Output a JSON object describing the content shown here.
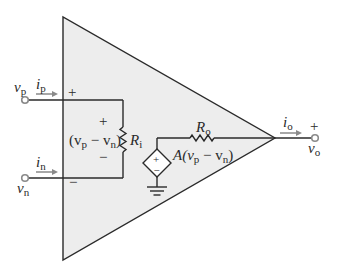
{
  "diagram": {
    "type": "op-amp equivalent circuit",
    "colors": {
      "background": "#ffffff",
      "amp_fill": "#ededed",
      "wire": "#2a2a2a",
      "terminal": "#8a8a8a",
      "arrow": "#8a8a8a"
    },
    "inputs": {
      "positive": {
        "voltage_label": "v",
        "voltage_sub": "p",
        "current_label": "i",
        "current_sub": "p",
        "sign": "+"
      },
      "negative": {
        "voltage_label": "v",
        "voltage_sub": "n",
        "current_label": "i",
        "current_sub": "n",
        "sign": "−"
      }
    },
    "input_resistor": {
      "label": "R",
      "sub": "i",
      "voltage_expr_open": "(v",
      "voltage_expr_p": "p",
      "voltage_expr_minus": " − v",
      "voltage_expr_n": "n",
      "voltage_expr_close": ")",
      "plus": "+",
      "minus": "−"
    },
    "dependent_source": {
      "expr_prefix": "A(v",
      "expr_p": "p",
      "expr_minus": " − v",
      "expr_n": "n",
      "expr_close": ")",
      "plus": "+",
      "minus": "−"
    },
    "output_resistor": {
      "label": "R",
      "sub": "o"
    },
    "output": {
      "voltage_label": "v",
      "voltage_sub": "o",
      "current_label": "i",
      "current_sub": "o",
      "sign": "+"
    }
  }
}
